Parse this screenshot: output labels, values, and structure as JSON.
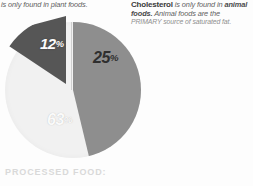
{
  "captions": {
    "left": {
      "text": "is only found in plant foods."
    },
    "right": {
      "lead": "Cholesterol",
      "line1_rest": " is only found in",
      "line2_bold": "animal foods.",
      "line2_rest": " Animal foods are the",
      "line3": "PRIMARY source of saturated fat."
    }
  },
  "chart_data": {
    "type": "pie",
    "title": "",
    "categories": [
      "25%",
      "12%",
      "63%"
    ],
    "values": [
      25,
      12,
      63
    ],
    "labels": [
      "25",
      "12",
      "63"
    ],
    "percent_sign": "%",
    "colors": [
      "#8e8e8e",
      "#565656",
      "#f1f1f1"
    ],
    "label_colors": [
      "#2f2f2f",
      "#fbfbfb",
      "#fafafa"
    ],
    "exploded": [
      "12%"
    ],
    "legend": "none",
    "grid": false
  },
  "footer": {
    "heading": "PROCESSED FOOD:"
  }
}
